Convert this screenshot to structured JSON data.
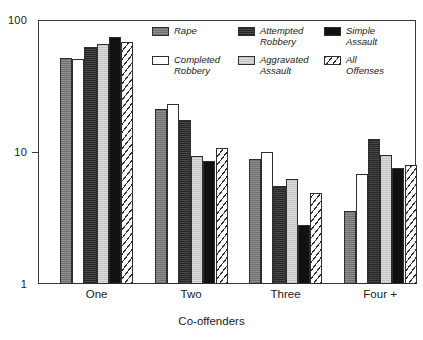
{
  "chart_data": {
    "type": "bar",
    "title": "",
    "subtitle": "",
    "xlabel": "Co-offenders",
    "ylabel": "",
    "yscale": "log",
    "ylim": [
      1,
      100
    ],
    "ytick_labels": [
      "100",
      "10",
      "1"
    ],
    "ytick_values": [
      100,
      10,
      1
    ],
    "grid": false,
    "legend_position": "top-center-inside",
    "categories": [
      "One",
      "Two",
      "Three",
      "Four +"
    ],
    "series": [
      {
        "name": "Rape",
        "color": "#7d7d7d",
        "pattern": "dark-gray",
        "values": [
          52,
          21,
          8.9,
          3.6
        ]
      },
      {
        "name": "Completed Robbery",
        "color": "#ffffff",
        "pattern": "white",
        "values": [
          51,
          23,
          10.0,
          6.8
        ]
      },
      {
        "name": "Attempted Robbery",
        "color": "#333333",
        "pattern": "very-dark",
        "values": [
          62,
          17.5,
          5.5,
          12.5
        ]
      },
      {
        "name": "Aggravated Assault",
        "color": "#cfcfcf",
        "pattern": "light-gray",
        "values": [
          66,
          9.4,
          6.3,
          9.5
        ]
      },
      {
        "name": "Simple Assault",
        "color": "#111111",
        "pattern": "black",
        "values": [
          75,
          8.5,
          2.8,
          7.6
        ]
      },
      {
        "name": "All Offenses",
        "color": "#ffffff",
        "pattern": "diagonal-hatch",
        "values": [
          68,
          10.8,
          4.9,
          8.0
        ]
      }
    ]
  },
  "legend": {
    "items": [
      {
        "label": "Rape",
        "swatch": "fill-rape"
      },
      {
        "label": "Attempted\nRobbery",
        "swatch": "fill-attempted-robbery"
      },
      {
        "label": "Simple\nAssault",
        "swatch": "fill-simple-assault"
      },
      {
        "label": "Completed\nRobbery",
        "swatch": "fill-completed-robbery"
      },
      {
        "label": "Aggravated\nAssault",
        "swatch": "fill-aggravated-assault"
      },
      {
        "label": "All\nOffenses",
        "swatch": "fill-all-offenses"
      }
    ]
  },
  "axis": {
    "x_title": "Co-offenders",
    "y_ticks": [
      "100",
      "10",
      "1"
    ]
  },
  "colors": {
    "frame": "#3a3a3a",
    "text": "#1a1a1a",
    "background": "#ffffff"
  }
}
